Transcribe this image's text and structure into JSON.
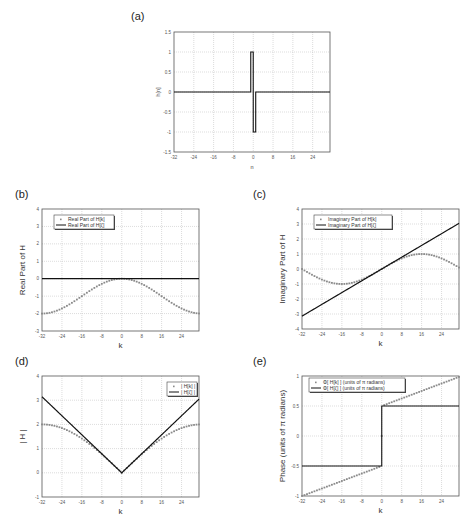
{
  "chart_data": [
    {
      "id": "a",
      "panel_label": "(a)",
      "type": "line",
      "title": "",
      "xlabel": "n",
      "ylabel": "h[n]",
      "xlim": [
        -32,
        31
      ],
      "ylim": [
        -1.5,
        1.5
      ],
      "xticks": [
        -32,
        -24,
        -16,
        -8,
        0,
        8,
        16,
        24
      ],
      "yticks": [
        -1.5,
        -1,
        -0.5,
        0,
        0.5,
        1,
        1.5
      ],
      "grid": true,
      "series": [
        {
          "name": "h[n]",
          "style": "line",
          "x": [
            -32,
            -1,
            -1,
            0,
            0,
            1,
            1,
            31
          ],
          "y": [
            0,
            0,
            1,
            1,
            -1,
            -1,
            0,
            0
          ]
        }
      ],
      "legend": null,
      "box": {
        "x": 174,
        "y": 32,
        "w": 156,
        "h": 120
      }
    },
    {
      "id": "b",
      "panel_label": "(b)",
      "type": "line",
      "xlabel": "k",
      "ylabel": "Real Part of H",
      "xlim": [
        -32,
        31
      ],
      "ylim": [
        -3,
        4
      ],
      "xticks": [
        -32,
        -24,
        -16,
        -8,
        0,
        8,
        16,
        24
      ],
      "yticks": [
        -3,
        -2,
        -1,
        0,
        1,
        2,
        3,
        4
      ],
      "grid": true,
      "series": [
        {
          "name": "Real Part of H[k]",
          "style": "markers",
          "func": "cos_minus_1"
        },
        {
          "name": "Real Part of H[ζ]",
          "style": "line",
          "func": "zero"
        }
      ],
      "legend": {
        "position": "upper-left",
        "entries": [
          "Real Part of H[k]",
          "Real Part of H[ζ]"
        ]
      },
      "box": {
        "x": 42,
        "y": 209,
        "w": 157,
        "h": 122
      }
    },
    {
      "id": "c",
      "panel_label": "(c)",
      "type": "line",
      "xlabel": "k",
      "ylabel": "Imaginary Part of H",
      "xlim": [
        -32,
        31
      ],
      "ylim": [
        -4,
        4
      ],
      "xticks": [
        -32,
        -24,
        -16,
        -8,
        0,
        8,
        16,
        24
      ],
      "yticks": [
        -4,
        -3,
        -2,
        -1,
        0,
        1,
        2,
        3,
        4
      ],
      "grid": true,
      "series": [
        {
          "name": "Imaginary Part of H[k]",
          "style": "markers",
          "func": "sin"
        },
        {
          "name": "Imaginary Part of H[ζ]",
          "style": "line",
          "func": "linear"
        }
      ],
      "legend": {
        "position": "upper-left",
        "entries": [
          "Imaginary Part of H[k]",
          "Imaginary Part of H[ζ]"
        ]
      },
      "box": {
        "x": 302,
        "y": 209,
        "w": 157,
        "h": 120
      }
    },
    {
      "id": "d",
      "panel_label": "(d)",
      "type": "line",
      "xlabel": "k",
      "ylabel": "| H |",
      "xlim": [
        -32,
        31
      ],
      "ylim": [
        -1,
        4
      ],
      "xticks": [
        -32,
        -24,
        -16,
        -8,
        0,
        8,
        16,
        24
      ],
      "yticks": [
        -1,
        0,
        1,
        2,
        3,
        4
      ],
      "grid": true,
      "series": [
        {
          "name": "| H[k] |",
          "style": "markers",
          "func": "abs_2sin_half"
        },
        {
          "name": "| H[ζ] |",
          "style": "line",
          "func": "abs_linear"
        }
      ],
      "legend": {
        "position": "upper-right",
        "entries": [
          "| H[k] |",
          "| H[ζ] |"
        ]
      },
      "box": {
        "x": 42,
        "y": 376,
        "w": 157,
        "h": 121
      }
    },
    {
      "id": "e",
      "panel_label": "(e)",
      "type": "line",
      "xlabel": "k",
      "ylabel": "Phase (units of π radians)",
      "xlim": [
        -32,
        31
      ],
      "ylim": [
        -1,
        1
      ],
      "xticks": [
        -32,
        -24,
        -16,
        -8,
        0,
        8,
        16,
        24
      ],
      "yticks": [
        -1,
        -0.5,
        0,
        0.5,
        1
      ],
      "grid": true,
      "series": [
        {
          "name": "Φ[ H[k] ] (units of π radians)",
          "style": "markers",
          "func": "phase_k"
        },
        {
          "name": "Φ[ H[ζ] ] (units of π radians)",
          "style": "line",
          "func": "phase_zeta"
        }
      ],
      "legend": {
        "position": "upper-left",
        "entries": [
          "Φ[ H[k] ] (units of π radians)",
          "Φ[ H[ζ] ] (units of π radians)"
        ]
      },
      "box": {
        "x": 302,
        "y": 376,
        "w": 157,
        "h": 120
      }
    }
  ],
  "colors": {
    "line": "#111111",
    "markers": "#8a8a8a",
    "grid": "#b8b8b8",
    "axis": "#555555"
  }
}
